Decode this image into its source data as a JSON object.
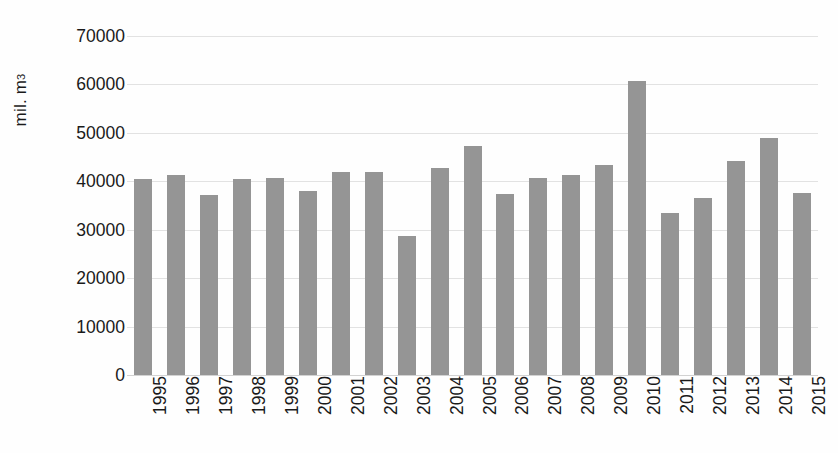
{
  "chart_data": {
    "type": "bar",
    "title": "",
    "subtitle": "",
    "xlabel": "",
    "ylabel": "mil. m3",
    "ylabel_base": "mil. m",
    "ylabel_sup": "3",
    "categories": [
      "1995",
      "1996",
      "1997",
      "1998",
      "1999",
      "2000",
      "2001",
      "2002",
      "2003",
      "2004",
      "2005",
      "2006",
      "2007",
      "2008",
      "2009",
      "2010",
      "2011",
      "2012",
      "2013",
      "2014",
      "2015"
    ],
    "values": [
      40500,
      41300,
      37200,
      40400,
      40600,
      38000,
      42000,
      42000,
      28800,
      42700,
      47200,
      37400,
      40700,
      41400,
      43300,
      60800,
      33500,
      36500,
      44100,
      49000,
      37500
    ],
    "ylim": [
      0,
      70000
    ],
    "ytick_values": [
      0,
      10000,
      20000,
      30000,
      40000,
      50000,
      60000,
      70000
    ],
    "ytick_labels": [
      "0",
      "10000",
      "20000",
      "30000",
      "40000",
      "50000",
      "60000",
      "70000"
    ],
    "grid": true,
    "legend": false,
    "legend_position": "none",
    "bar_color": "#959595",
    "gridline_color": "#e2e2e2",
    "text_color": "#1a1a1a",
    "background_color": "#fefefe"
  }
}
